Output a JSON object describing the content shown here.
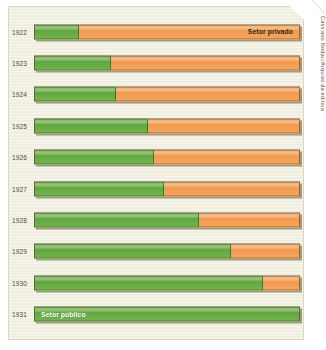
{
  "credit": "Cassiano Nodari/Arquivo da editora",
  "labels": {
    "private": "Setor privado",
    "public": "Setor público"
  },
  "colors": {
    "public": "#62a63f",
    "private": "#f29a4e",
    "panel": "#f2f1e4",
    "outline": "#463714"
  },
  "chart_data": {
    "type": "bar",
    "orientation": "horizontal",
    "stacked": true,
    "normalized": true,
    "title": "",
    "subtitle": "",
    "xlabel": "",
    "ylabel": "",
    "xlim": [
      0,
      100
    ],
    "grid": false,
    "legend": "inline-bar-annotations",
    "categories": [
      "1922",
      "1923",
      "1924",
      "1925",
      "1926",
      "1927",
      "1928",
      "1929",
      "1930",
      "1931"
    ],
    "series": [
      {
        "name": "Setor público",
        "color": "#62a63f",
        "values": [
          17,
          29,
          31,
          43,
          45,
          49,
          62,
          74,
          86,
          100
        ]
      },
      {
        "name": "Setor privado",
        "color": "#f29a4e",
        "values": [
          83,
          71,
          69,
          57,
          55,
          51,
          38,
          26,
          14,
          0
        ]
      }
    ],
    "annotations": [
      {
        "text": "Setor privado",
        "row": "1922",
        "segment": "Setor privado",
        "align": "right"
      },
      {
        "text": "Setor público",
        "row": "1931",
        "segment": "Setor público",
        "align": "left"
      }
    ]
  },
  "rows": [
    {
      "year": "1922",
      "public": 17,
      "private": 83
    },
    {
      "year": "1923",
      "public": 29,
      "private": 71
    },
    {
      "year": "1924",
      "public": 31,
      "private": 69
    },
    {
      "year": "1925",
      "public": 43,
      "private": 57
    },
    {
      "year": "1926",
      "public": 45,
      "private": 55
    },
    {
      "year": "1927",
      "public": 49,
      "private": 51
    },
    {
      "year": "1928",
      "public": 62,
      "private": 38
    },
    {
      "year": "1929",
      "public": 74,
      "private": 26
    },
    {
      "year": "1930",
      "public": 86,
      "private": 14
    },
    {
      "year": "1931",
      "public": 100,
      "private": 0
    }
  ]
}
